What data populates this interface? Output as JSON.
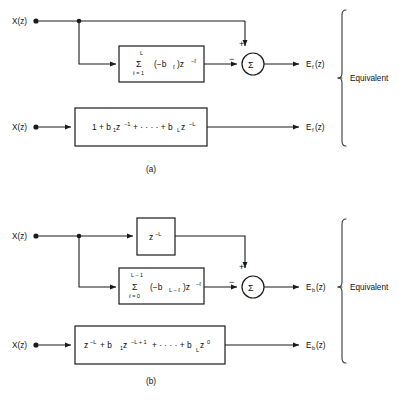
{
  "figure": {
    "type": "signal-flow-block-diagram",
    "caption_a": "(a)",
    "caption_b": "(b)",
    "equivalent_label_a": "Equivalent",
    "equivalent_label_b": "Equivalent"
  },
  "diagram_a": {
    "input_label": "X(z)",
    "input_label_2": "X(z)",
    "output_label": "E",
    "output_sub": "f",
    "output_tail": "(z)",
    "output_label_2": "E",
    "output_sub_2": "f",
    "output_tail_2": "(z)",
    "sum_symbol": "Σ",
    "sign_top": "+",
    "sign_left": "−",
    "filter_box": {
      "sigma": "Σ",
      "upper_limit": "L",
      "lower_limit": "ℓ = 1",
      "body_open": "(−b",
      "body_sub": "ℓ",
      "body_close": ")z",
      "body_exp": "−ℓ",
      "full_text": "Σ(ℓ=1..L) (−bℓ)z^(−ℓ)"
    },
    "equiv_box": {
      "t1": "1 + b",
      "s1": "1",
      "t2": " z",
      "e2": "−1",
      "t3": " + · · · · + b",
      "s3": "L",
      "t4": " z",
      "e4": "−L",
      "full_text": "1 + b₁z⁻¹ + · · · + bₗz⁻ᴸ"
    }
  },
  "diagram_b": {
    "input_label": "X(z)",
    "input_label_2": "X(z)",
    "output_label": "E",
    "output_sub": "b",
    "output_tail": "(z)",
    "output_label_2": "E",
    "output_sub_2": "b",
    "output_tail_2": "(z)",
    "sum_symbol": "Σ",
    "sign_top": "+",
    "sign_left": "−",
    "delay_box": {
      "base": "z",
      "exp": "−L",
      "full_text": "z⁻ᴸ"
    },
    "filter_box": {
      "sigma": "Σ",
      "upper_limit": "L − 1",
      "lower_limit": "ℓ = 0",
      "body_open": "(−b",
      "body_sub": "L − ℓ",
      "body_close": ")z",
      "body_exp": "−ℓ",
      "full_text": "Σ(ℓ=0..L−1) (−b_{L−ℓ})z^(−ℓ)"
    },
    "equiv_box": {
      "t1": "z",
      "e1": "−L",
      "t2": " + b",
      "s2": "1",
      "t3": " z",
      "e3": "−L + 1",
      "t4": " + · · · · + b",
      "s4": "L",
      "t5": " z",
      "e5": "0",
      "full_text": "z⁻ᴸ + b₁z⁻ᴸ⁺¹ + · · · + bₗz⁰"
    }
  },
  "colors": {
    "line": "#1a1a1a",
    "brace": "#3a3a3a",
    "background": "#ffffff",
    "text": "#111111"
  }
}
